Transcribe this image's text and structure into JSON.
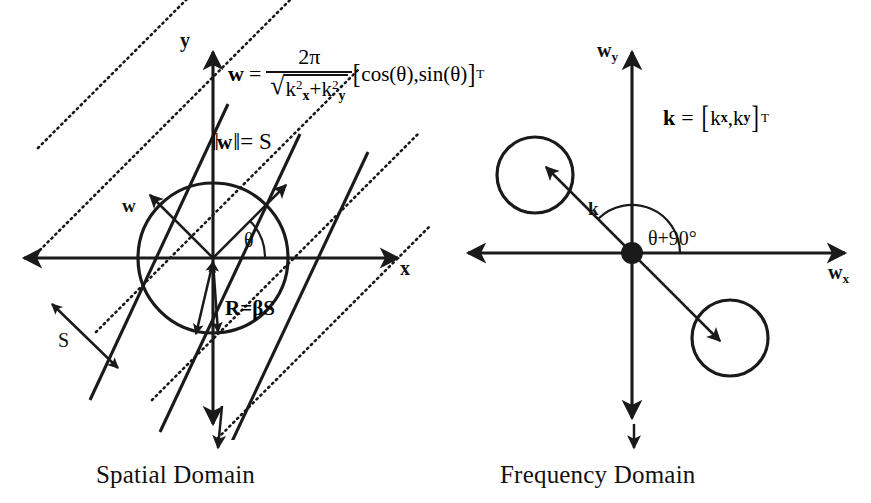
{
  "figure": {
    "background_color": "#ffffff",
    "ink_color": "#1a1a1a"
  },
  "panels": [
    {
      "id": "spatial",
      "caption": "Spatial Domain",
      "axes": {
        "x_label": "x",
        "y_label": "y"
      },
      "labels": {
        "vector_w": "w",
        "angle": "θ",
        "norm": {
          "bars": "‖",
          "symbol": "w",
          "equals": "= S"
        },
        "spacing": "S",
        "radius": {
          "r": "R",
          "eq": "=",
          "beta": "β",
          "s": "S"
        }
      },
      "formula": {
        "lhs": "w",
        "equals": "=",
        "numerator": "2π",
        "denominator_radical": "√",
        "denominator": "k²x + k²y",
        "den_k1": "k",
        "den_k1_sub": "x",
        "den_plus": "+",
        "den_k2": "k",
        "den_k2_sub": "y",
        "den_exp": "2",
        "bracket_open": "[",
        "bracket_body": "cos(θ),sin(θ)",
        "bracket_close": "]",
        "transpose": "T"
      }
    },
    {
      "id": "frequency",
      "caption": "Frequency Domain",
      "axes": {
        "x_label": "w",
        "x_sub": "x",
        "y_label": "w",
        "y_sub": "y"
      },
      "labels": {
        "vector_k": "k",
        "angle": "θ+90°"
      },
      "formula": {
        "lhs": "k",
        "equals": "=",
        "bracket_open": "[",
        "k1": "k",
        "k1_sub": "x",
        "comma": ",",
        "k2": "k",
        "k2_sub": "y",
        "bracket_close": "]",
        "transpose": "T"
      }
    }
  ],
  "geometry": {
    "spatial": {
      "origin": [
        213,
        258
      ],
      "circle_radius": 75,
      "x_axis": [
        8,
        418
      ],
      "y_axis": [
        38,
        440
      ],
      "theta_degrees": 45,
      "dotted_line_count": 4,
      "solid_line_count": 3
    },
    "frequency": {
      "origin": [
        632,
        253
      ],
      "x_axis": [
        452,
        860
      ],
      "y_axis": [
        38,
        432
      ],
      "lobe_upper_left": {
        "center": [
          535,
          175
        ],
        "radius": 38
      },
      "lobe_lower_right": {
        "center": [
          730,
          338
        ],
        "radius": 38
      }
    }
  }
}
